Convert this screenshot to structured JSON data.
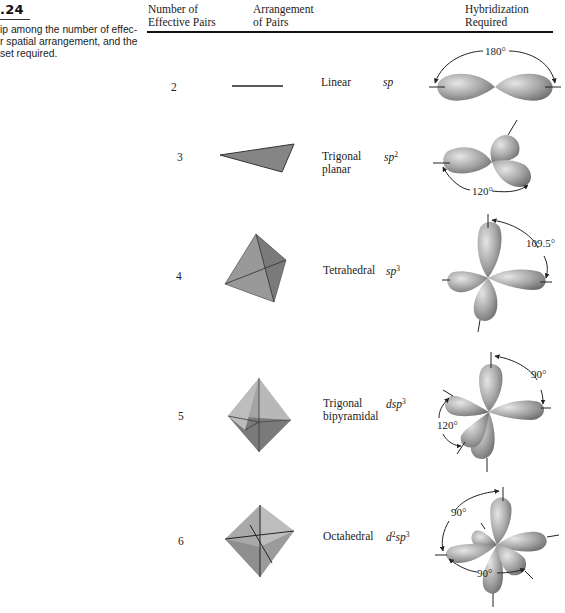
{
  "caption": {
    "figure_number": ".24",
    "lines": [
      "ip among the number of effec-",
      "r spatial arrangement, and the",
      "set required."
    ]
  },
  "table": {
    "headers": {
      "effective_pairs": [
        "Number of",
        "Effective Pairs"
      ],
      "arrangement": [
        "Arrangement",
        "of Pairs"
      ],
      "hybridization": [
        "Hybridization",
        "Required"
      ]
    },
    "rows": [
      {
        "pairs": "2",
        "arrangement": [
          "Linear"
        ],
        "hyb_base": "sp",
        "hyb_sup": "",
        "hyb_prefix": "",
        "hyb_prefix_sup": "",
        "shape": "line",
        "angles": [
          "180°"
        ]
      },
      {
        "pairs": "3",
        "arrangement": [
          "Trigonal",
          "planar"
        ],
        "hyb_base": "sp",
        "hyb_sup": "2",
        "hyb_prefix": "",
        "hyb_prefix_sup": "",
        "shape": "triangle",
        "angles": [
          "120°"
        ]
      },
      {
        "pairs": "4",
        "arrangement": [
          "Tetrahedral"
        ],
        "hyb_base": "sp",
        "hyb_sup": "3",
        "hyb_prefix": "",
        "hyb_prefix_sup": "",
        "shape": "tetrahedron",
        "angles": [
          "109.5°"
        ]
      },
      {
        "pairs": "5",
        "arrangement": [
          "Trigonal",
          "bipyramidal"
        ],
        "hyb_base": "sp",
        "hyb_sup": "3",
        "hyb_prefix": "d",
        "hyb_prefix_sup": "",
        "shape": "trigonal-bipyramid",
        "angles": [
          "90°",
          "120°"
        ]
      },
      {
        "pairs": "6",
        "arrangement": [
          "Octahedral"
        ],
        "hyb_base": "sp",
        "hyb_sup": "3",
        "hyb_prefix": "d",
        "hyb_prefix_sup": "2",
        "shape": "octahedron",
        "angles": [
          "90°",
          "90°"
        ]
      }
    ]
  },
  "colors": {
    "lobe_fill": "#9a9a9a",
    "lobe_highlight": "#d9d9d9",
    "shape_dark": "#6e6e6e",
    "shape_mid": "#8c8c8c",
    "shape_light": "#b5b5b5",
    "text": "#231f20"
  }
}
